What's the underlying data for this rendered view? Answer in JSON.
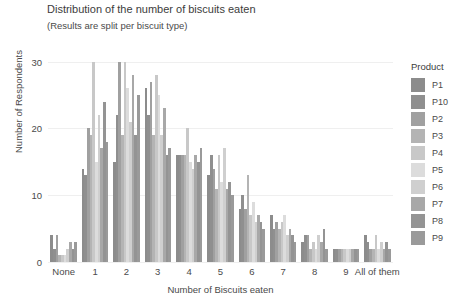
{
  "chart_data": {
    "type": "bar",
    "title": "Distribution of the number of biscuits eaten",
    "subtitle": "(Results are split per biscuit type)",
    "xlabel": "Number of Biscuits eaten",
    "ylabel": "Number of Respondents",
    "ylim": [
      0,
      31
    ],
    "yticks": [
      0,
      10,
      20,
      30
    ],
    "grid": true,
    "legend_position": "right",
    "legend_title": "Product",
    "categories": [
      "None",
      "1",
      "2",
      "3",
      "4",
      "5",
      "6",
      "7",
      "8",
      "9",
      "All of them"
    ],
    "series": [
      {
        "name": "P1",
        "color": "#8c8c8c",
        "values": [
          4,
          14,
          15,
          26,
          16,
          13,
          8,
          7,
          3,
          2,
          4
        ]
      },
      {
        "name": "P10",
        "color": "#8f8f8f",
        "values": [
          2,
          13,
          22,
          22,
          16,
          16,
          10,
          5,
          4,
          2,
          3
        ]
      },
      {
        "name": "P2",
        "color": "#a0a0a0",
        "values": [
          4,
          20,
          30,
          27,
          16,
          14,
          8,
          6,
          4,
          2,
          2
        ]
      },
      {
        "name": "P3",
        "color": "#b4b4b4",
        "values": [
          1,
          19,
          19,
          19,
          16,
          11,
          13,
          5,
          2,
          2,
          2
        ]
      },
      {
        "name": "P4",
        "color": "#c8c8c8",
        "values": [
          1,
          30,
          30,
          28,
          20,
          16,
          7,
          6,
          3,
          2,
          4
        ]
      },
      {
        "name": "P5",
        "color": "#dcdcdc",
        "values": [
          1,
          15,
          26,
          25,
          15,
          12,
          9,
          7,
          2,
          2,
          2
        ]
      },
      {
        "name": "P6",
        "color": "#cfcfcf",
        "values": [
          2,
          22,
          21,
          19,
          14,
          17,
          6,
          4,
          4,
          2,
          3
        ]
      },
      {
        "name": "P7",
        "color": "#a8a8a8",
        "values": [
          3,
          17,
          28,
          23,
          16,
          11,
          7,
          5,
          3,
          2,
          2
        ]
      },
      {
        "name": "P8",
        "color": "#949494",
        "values": [
          2,
          24,
          19,
          16,
          15,
          12,
          6,
          4,
          5,
          2,
          3
        ]
      },
      {
        "name": "P9",
        "color": "#9a9a9a",
        "values": [
          3,
          18,
          25,
          17,
          17,
          10,
          5,
          3,
          2,
          2,
          2
        ]
      }
    ]
  }
}
